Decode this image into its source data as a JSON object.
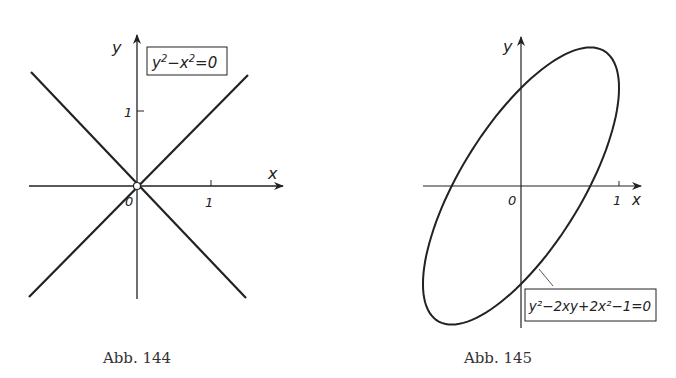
{
  "figures": [
    {
      "caption": "Abb. 144",
      "equation": "y²−x²=0",
      "eq_parts": {
        "a": "y",
        "a_exp": "2",
        "mid": "−x",
        "b_exp": "2",
        "end": "=0"
      },
      "axis_x": "x",
      "axis_y": "y",
      "origin_label": "0",
      "tick_x": "1",
      "tick_y": "1",
      "curve": "two lines y = x and y = −x"
    },
    {
      "caption": "Abb. 145",
      "equation": "y²−2xy+2x²−1=0",
      "axis_x": "x",
      "axis_y": "y",
      "origin_label": "0",
      "tick_x": "1",
      "curve": "ellipse y = x ± sqrt(1 − x²)"
    }
  ],
  "colors": {
    "ink": "#222222",
    "background": "#ffffff"
  }
}
